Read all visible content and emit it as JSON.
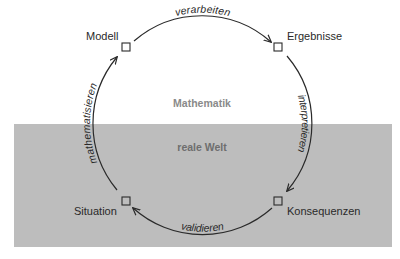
{
  "diagram": {
    "regions": {
      "top": "Mathematik",
      "bottom": "reale Welt"
    },
    "nodes": {
      "top_left": "Modell",
      "top_right": "Ergebnisse",
      "bottom_left": "Situation",
      "bottom_right": "Konsequenzen"
    },
    "edges": {
      "top": "verarbeiten",
      "right": "interpretieren",
      "bottom": "validieren",
      "left": "mathematisieren"
    },
    "edge_flow": [
      {
        "from": "Situation",
        "to": "Modell",
        "label": "mathematisieren"
      },
      {
        "from": "Modell",
        "to": "Ergebnisse",
        "label": "verarbeiten"
      },
      {
        "from": "Ergebnisse",
        "to": "Konsequenzen",
        "label": "interpretieren"
      },
      {
        "from": "Konsequenzen",
        "to": "Situation",
        "label": "validieren"
      }
    ],
    "colors": {
      "background": "#ffffff",
      "real_world_band": "#bdbdbd",
      "line": "#2a2a2a"
    }
  }
}
